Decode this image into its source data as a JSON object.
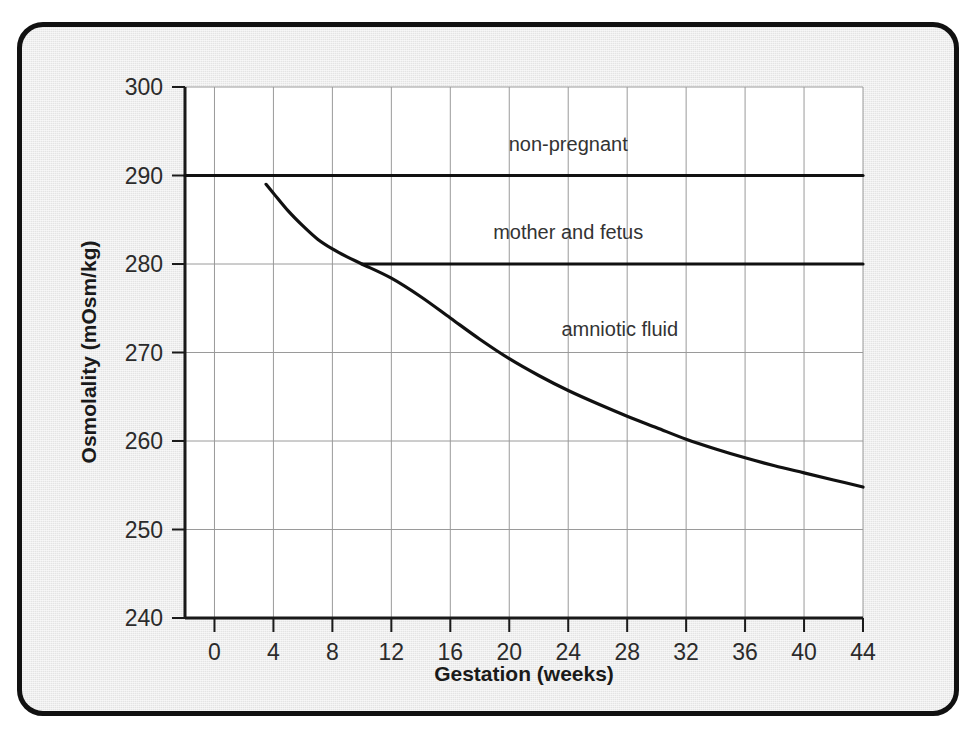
{
  "figure": {
    "background_color": "#e4e4e4",
    "border_color": "#111111",
    "plot_background_color": "#ffffff",
    "line_color": "#111111",
    "grid_color": "#9a9a9a"
  },
  "chart_data": {
    "type": "line",
    "title": "",
    "xlabel": "Gestation (weeks)",
    "ylabel": "Osmolality (mOsm/kg)",
    "xlim": [
      -2,
      44
    ],
    "ylim": [
      240,
      300
    ],
    "xticks": [
      0,
      4,
      8,
      12,
      16,
      20,
      24,
      28,
      32,
      36,
      40,
      44
    ],
    "xtick_labels": [
      "0",
      "4",
      "8",
      "12",
      "16",
      "20",
      "24",
      "28",
      "32",
      "36",
      "40",
      "44"
    ],
    "yticks": [
      240,
      250,
      260,
      270,
      280,
      290,
      300
    ],
    "ytick_labels": [
      "240",
      "250",
      "260",
      "270",
      "280",
      "290",
      "300"
    ],
    "grid": true,
    "legend_position": "inline-annotations",
    "series": [
      {
        "name": "non-pregnant",
        "label": "non-pregnant",
        "label_x": 24,
        "label_y": 293.5,
        "x": [
          -2,
          44
        ],
        "values": [
          290,
          290
        ]
      },
      {
        "name": "mother and fetus",
        "label": "mother and fetus",
        "label_x": 24,
        "label_y": 283.5,
        "x": [
          10,
          44
        ],
        "values": [
          280,
          280
        ]
      },
      {
        "name": "amniotic fluid",
        "label": "amniotic fluid",
        "label_x": 27.5,
        "label_y": 272.5,
        "x": [
          3.5,
          4,
          5,
          6,
          7,
          8,
          9,
          10,
          12,
          14,
          16,
          18,
          20,
          22,
          24,
          26,
          28,
          30,
          32,
          34,
          36,
          38,
          40,
          42,
          44
        ],
        "values": [
          289,
          288,
          286,
          284.3,
          282.8,
          281.7,
          280.8,
          280,
          278.4,
          276.3,
          273.9,
          271.5,
          269.3,
          267.4,
          265.7,
          264.2,
          262.8,
          261.5,
          260.2,
          259.1,
          258.1,
          257.2,
          256.4,
          255.6,
          254.8
        ]
      }
    ]
  }
}
